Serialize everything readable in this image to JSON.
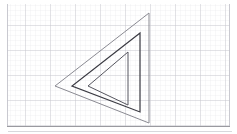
{
  "canvas": {
    "width": 237,
    "height": 134,
    "background_color": "#ffffff",
    "description": "Graph-paper drawing canvas with three nested left-pointing triangles"
  },
  "grid": {
    "minor_spacing": 5,
    "major_spacing": 25,
    "minor_color": "#e9e9ee",
    "major_color": "#c3c3cb",
    "origin_x": 7,
    "origin_y": 4,
    "right_edge": 230,
    "bottom_edge": 126
  },
  "border": {
    "color": "#b5b5bb",
    "bottom_rule_color": "#9a9aa0",
    "left_x": 7,
    "right_x": 230,
    "bottom_y": 126.5,
    "baseline_y": 131.5,
    "baseline_color": "#d8d8dc"
  },
  "shapes": {
    "outer_triangle": {
      "label": "outer-triangle",
      "points": "149,13 55,86 149,123",
      "stroke_color": "#8a8a92",
      "stroke_width": 1.0,
      "fill": "none",
      "vertices": {
        "top": [
          149,
          13
        ],
        "left": [
          55,
          86
        ],
        "bottom": [
          149,
          123
        ]
      }
    },
    "middle_triangle": {
      "label": "middle-triangle",
      "points": "140,33 72,86 140,112",
      "stroke_color": "#3a3a42",
      "stroke_width": 1.2,
      "fill": "none",
      "vertices": {
        "top": [
          140,
          33
        ],
        "left": [
          72,
          86
        ],
        "bottom": [
          140,
          112
        ]
      }
    },
    "inner_triangle": {
      "label": "inner-triangle",
      "points": "128,52 88,86 128,105",
      "stroke_color": "#55555e",
      "stroke_width": 1.0,
      "fill": "none",
      "vertices": {
        "top": [
          128,
          52
        ],
        "left": [
          88,
          86
        ],
        "bottom": [
          128,
          105
        ]
      }
    }
  }
}
